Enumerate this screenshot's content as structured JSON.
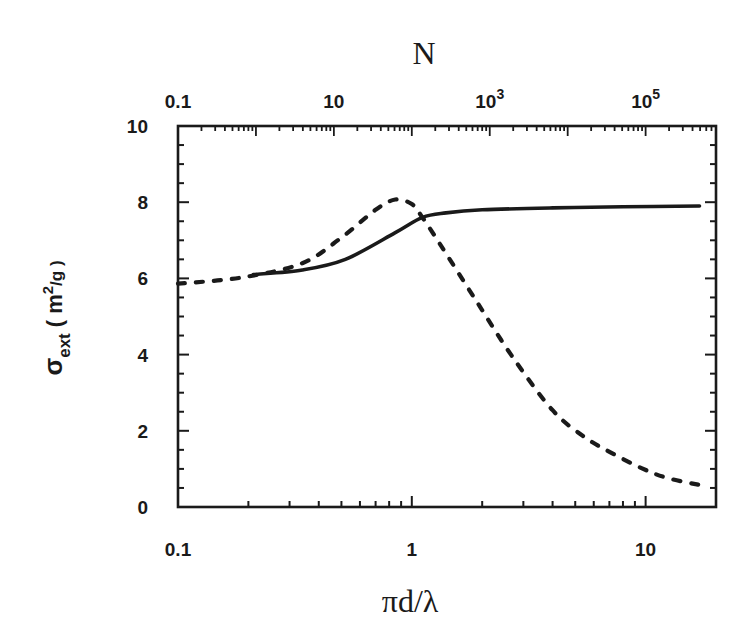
{
  "chart_data": {
    "type": "line",
    "title": "",
    "xlabel": "πd/λ",
    "ylabel": "σ_ext (m²/g)",
    "ylabel_parts": {
      "symbol": "σ",
      "subscript": "ext",
      "units_open": "( m",
      "units_sup": "2",
      "units_close": "/g )"
    },
    "x_scale": "log",
    "xlim": [
      0.1,
      20
    ],
    "ylim": [
      0,
      10
    ],
    "grid": false,
    "legend": null,
    "x_ticks": [
      0.1,
      1,
      10
    ],
    "x_tick_labels": [
      "0.1",
      "1",
      "10"
    ],
    "y_ticks": [
      0,
      2,
      4,
      6,
      8,
      10
    ],
    "y_tick_labels": [
      "0",
      "2",
      "4",
      "6",
      "8",
      "10"
    ],
    "top_axis": {
      "label": "N",
      "scale": "log",
      "range": [
        0.1,
        800000
      ],
      "ticks": [
        0.1,
        10,
        1000,
        100000
      ],
      "tick_labels": [
        {
          "base": "0.1",
          "exp": ""
        },
        {
          "base": "10",
          "exp": ""
        },
        {
          "base": "10",
          "exp": "3"
        },
        {
          "base": "10",
          "exp": "5"
        }
      ]
    },
    "series": [
      {
        "name": "solid",
        "style": "solid",
        "x": [
          0.21,
          0.34,
          0.52,
          0.85,
          1.11,
          1.4,
          2.0,
          4.0,
          8.0,
          17.0
        ],
        "y": [
          6.1,
          6.22,
          6.5,
          7.2,
          7.6,
          7.72,
          7.8,
          7.85,
          7.88,
          7.9
        ]
      },
      {
        "name": "dashed",
        "style": "dashed",
        "x": [
          0.1,
          0.19,
          0.34,
          0.5,
          0.7,
          0.85,
          1.0,
          1.11,
          1.32,
          1.86,
          2.67,
          4.0,
          5.5,
          7.2,
          9.6,
          12.4,
          17.0
        ],
        "y": [
          5.86,
          6.03,
          6.4,
          7.07,
          7.8,
          8.07,
          7.95,
          7.6,
          6.9,
          5.47,
          3.98,
          2.54,
          1.83,
          1.41,
          1.02,
          0.76,
          0.58
        ]
      }
    ]
  },
  "colors": {
    "ink": "#1a1a1a",
    "background": "#ffffff"
  }
}
